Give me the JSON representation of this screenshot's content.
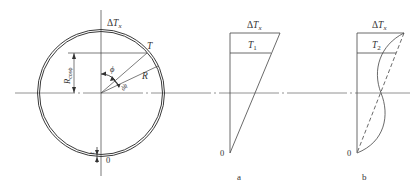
{
  "figure": {
    "circle": {
      "top_label_delta": "Δ",
      "top_label_T": "T",
      "top_label_sub": "x",
      "point_T": "T",
      "radius_label": "R",
      "angle_label": "ϕ",
      "dphi_label": "dϕ",
      "rcos_label_R": "R",
      "rcos_label_sub": "cosϕ",
      "thickness_label": "t",
      "bottom_label": "0"
    },
    "panel_a": {
      "top_label_delta": "Δ",
      "top_label_T": "T",
      "top_label_sub": "x",
      "inner_label_T": "T",
      "inner_label_sub": "1",
      "origin_label": "0",
      "caption": "a"
    },
    "panel_b": {
      "top_label_delta": "Δ",
      "top_label_T": "T",
      "top_label_sub": "x",
      "inner_label_T": "T",
      "inner_label_sub": "2",
      "origin_label": "0",
      "caption": "b"
    },
    "colors": {
      "line": "#3a3a3a",
      "axis": "#666666"
    }
  }
}
